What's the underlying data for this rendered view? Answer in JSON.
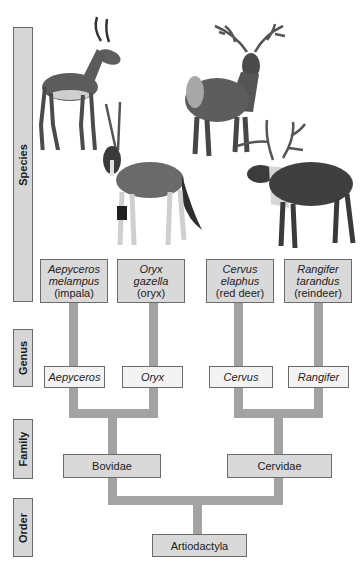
{
  "ranks": {
    "species": "Species",
    "genus": "Genus",
    "family": "Family",
    "order": "Order"
  },
  "species": [
    {
      "genus_part": "Aepyceros",
      "species_part": "melampus",
      "common": "(impala)"
    },
    {
      "genus_part": "Oryx",
      "species_part": "gazella",
      "common": "(oryx)"
    },
    {
      "genus_part": "Cervus",
      "species_part": "elaphus",
      "common": "(red deer)"
    },
    {
      "genus_part": "Rangifer",
      "species_part": "tarandus",
      "common": "(reindeer)"
    }
  ],
  "genera": [
    "Aepyceros",
    "Oryx",
    "Cervus",
    "Rangifer"
  ],
  "families": [
    "Bovidae",
    "Cervidae"
  ],
  "order": "Artiodactyla",
  "illustrations": [
    "impala",
    "oryx",
    "red deer",
    "reindeer"
  ],
  "colors": {
    "box_fill": "#d9d9d9",
    "genus_fill": "#f3f3f3",
    "connector": "#a3a3a3",
    "border": "#6b6b6b"
  }
}
